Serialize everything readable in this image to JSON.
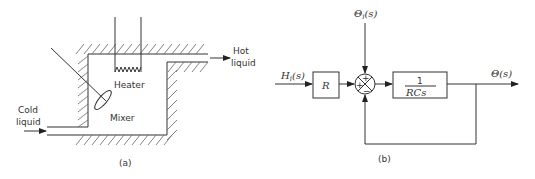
{
  "figure_a": {
    "caption": "(a)",
    "labels": {
      "heater": "Heater",
      "mixer": "Mixer",
      "cold_liquid_line1": "Cold",
      "cold_liquid_line2": "liquid",
      "hot_liquid_line1": "Hot",
      "hot_liquid_line2": "liquid"
    }
  },
  "figure_b": {
    "caption": "(b)",
    "input_heat": "H",
    "input_heat_sub": "i",
    "input_heat_arg": "(s)",
    "input_temp": "Θ",
    "input_temp_sub": "i",
    "input_temp_arg": "(s)",
    "output": "Θ(s)",
    "block_r": "R",
    "block_tf_num": "1",
    "block_tf_den": "RCs",
    "sum_signs": {
      "top": "+",
      "left": "+",
      "bottom": "−"
    }
  }
}
